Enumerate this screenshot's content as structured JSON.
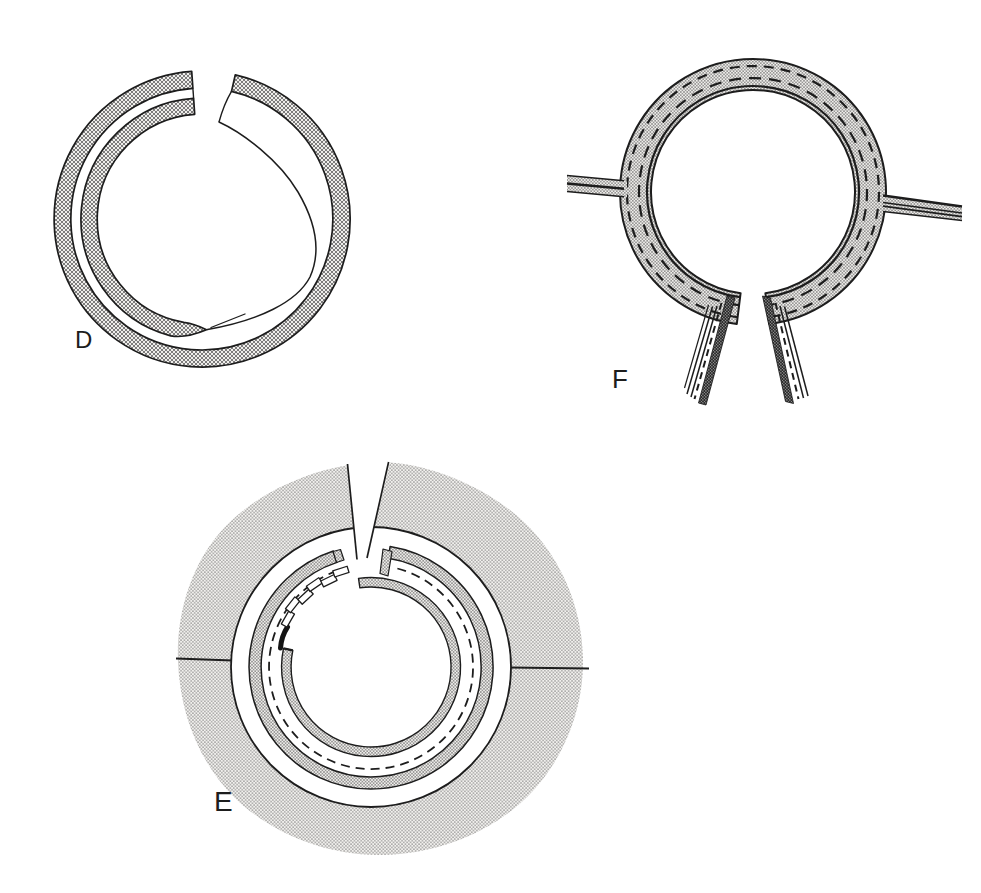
{
  "page": {
    "background": "#ffffff",
    "ink_color": "#1d1d1d",
    "stipple_tone": "#c4c4c4"
  },
  "labels": {
    "d": "D",
    "e": "E",
    "f": "F"
  }
}
